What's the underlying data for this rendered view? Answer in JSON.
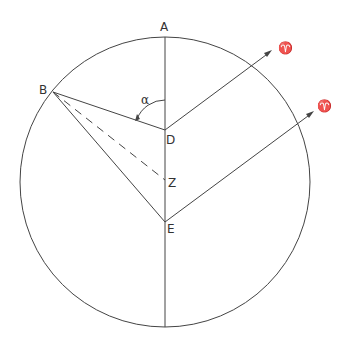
{
  "diagram": {
    "type": "geometric-construction",
    "circle": {
      "cx": 165,
      "cy": 182,
      "r": 145
    },
    "points": {
      "A": {
        "label": "A",
        "x": 165,
        "y": 37
      },
      "B": {
        "label": "B",
        "x": 53,
        "y": 92
      },
      "D": {
        "label": "D",
        "x": 165,
        "y": 130
      },
      "Z": {
        "label": "Z",
        "x": 165,
        "y": 180
      },
      "E": {
        "label": "E",
        "x": 165,
        "y": 222
      }
    },
    "angle_label": "α",
    "aries_symbol": "♈",
    "aries_arrows": [
      {
        "from": "D",
        "symbol": "♈"
      },
      {
        "from": "E",
        "symbol": "♈"
      }
    ],
    "segments": [
      "A-bottom (vertical diameter)",
      "B-D",
      "B-E",
      "B-Z (dashed)",
      "D→♈",
      "E→♈"
    ]
  }
}
